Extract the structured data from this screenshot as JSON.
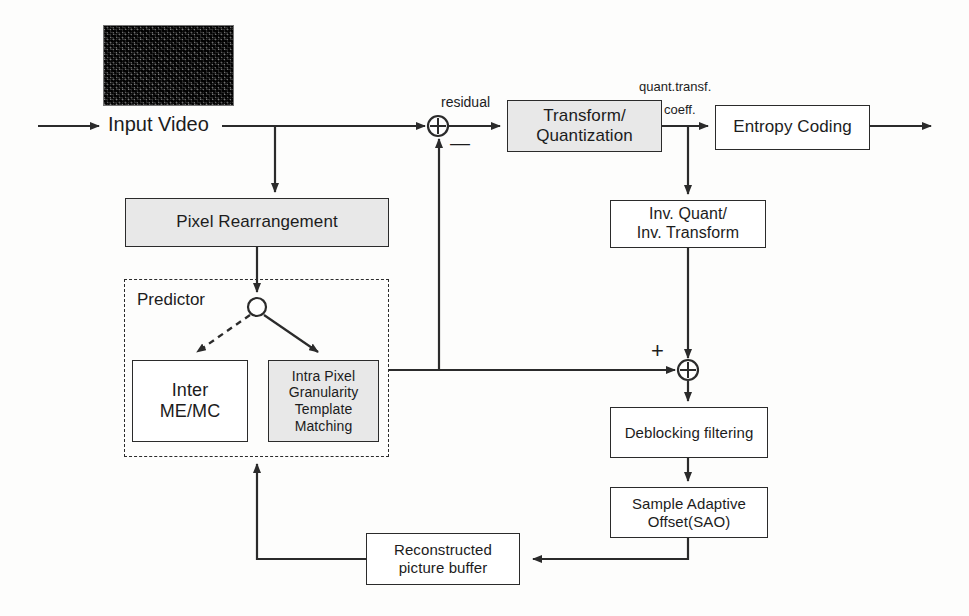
{
  "diagram": {
    "thumbnail": {
      "name": "input-video-frame-thumbnail"
    },
    "labels": {
      "input_video": "Input Video",
      "residual": "residual",
      "quant_transf": "quant.transf.",
      "coeff": "coeff.",
      "predictor": "Predictor",
      "minus_sign": "—",
      "plus_sign": "+"
    },
    "blocks": [
      {
        "id": "pixel-rearrangement",
        "lines": [
          "Pixel Rearrangement"
        ],
        "x": 125,
        "y": 198,
        "w": 264,
        "h": 49,
        "font_size": 17,
        "shaded": true
      },
      {
        "id": "transform-quantization",
        "lines": [
          "Transform/",
          "Quantization"
        ],
        "x": 507,
        "y": 100,
        "w": 155,
        "h": 52,
        "font_size": 17,
        "shaded": true
      },
      {
        "id": "entropy-coding",
        "lines": [
          "Entropy Coding"
        ],
        "x": 715,
        "y": 105,
        "w": 155,
        "h": 45,
        "font_size": 17,
        "shaded": false
      },
      {
        "id": "inv-quant-inv-transform",
        "lines": [
          "Inv. Quant/",
          "Inv. Transform"
        ],
        "x": 610,
        "y": 200,
        "w": 156,
        "h": 48,
        "font_size": 16,
        "shaded": false
      },
      {
        "id": "inter-me-mc",
        "lines": [
          "Inter",
          "ME/MC"
        ],
        "x": 132,
        "y": 360,
        "w": 116,
        "h": 82,
        "font_size": 18,
        "shaded": false
      },
      {
        "id": "intra-pixel-granularity-template-matching",
        "lines": [
          "Intra Pixel",
          "Granularity",
          "Template",
          "Matching"
        ],
        "x": 268,
        "y": 360,
        "w": 111,
        "h": 82,
        "font_size": 14,
        "shaded": true
      },
      {
        "id": "deblocking-filtering",
        "lines": [
          "Deblocking filtering"
        ],
        "x": 610,
        "y": 407,
        "w": 158,
        "h": 51,
        "font_size": 15,
        "shaded": false
      },
      {
        "id": "sample-adaptive-offset",
        "lines": [
          "Sample Adaptive",
          "Offset(SAO)"
        ],
        "x": 610,
        "y": 487,
        "w": 158,
        "h": 51,
        "font_size": 15,
        "shaded": false
      },
      {
        "id": "reconstructed-picture-buffer",
        "lines": [
          "Reconstructed",
          "picture buffer"
        ],
        "x": 366,
        "y": 533,
        "w": 154,
        "h": 52,
        "font_size": 15,
        "shaded": false
      }
    ],
    "groups": [
      {
        "id": "predictor-group",
        "label": "Predictor",
        "x": 124,
        "y": 279,
        "w": 265,
        "h": 178
      }
    ],
    "junctions": [
      {
        "id": "subtract-adder",
        "cx": 438,
        "cy": 126,
        "r": 10,
        "symbol": "⊕",
        "sign": "—"
      },
      {
        "id": "sum-adder",
        "cx": 688,
        "cy": 370,
        "r": 10,
        "symbol": "⊕",
        "sign": "+"
      },
      {
        "id": "predictor-mode-switch",
        "cx": 257,
        "cy": 307,
        "r": 9,
        "symbol": "",
        "sign": ""
      }
    ],
    "colors": {
      "stroke": "#2b2b2b",
      "shaded_fill": "#e8e8e8",
      "page_bg": "#fdfdfc",
      "text": "#1c1c1c"
    }
  }
}
